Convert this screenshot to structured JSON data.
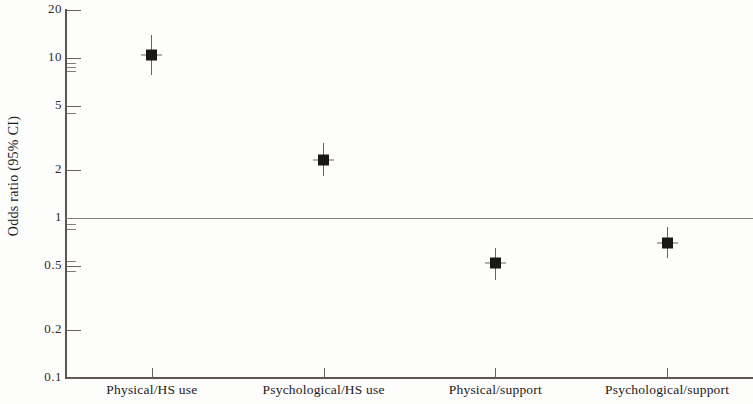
{
  "chart_data": {
    "type": "scatter",
    "title": "",
    "subtitle": "",
    "xlabel": "",
    "ylabel": "Odds ratio (95% CI)",
    "yscale": "log",
    "ylim": [
      0.1,
      20
    ],
    "grid": false,
    "legend": "none",
    "reference_line": {
      "value": 1,
      "label": "1",
      "color": "#8a7f78"
    },
    "ytick_labels": [
      "20",
      "10",
      "5",
      "2",
      "1",
      "0.5",
      "0.2",
      "0.1"
    ],
    "ytick_values": [
      20,
      10,
      5,
      2,
      1,
      0.5,
      0.2,
      0.1
    ],
    "categories": [
      "Physical/HS use",
      "Psychological/HS use",
      "Physical/support",
      "Psychological/support"
    ],
    "values": [
      10.5,
      2.3,
      0.52,
      0.7
    ],
    "ci_low": [
      8.6,
      2.0,
      0.45,
      0.61
    ],
    "ci_high": [
      12.8,
      2.7,
      0.6,
      0.81
    ],
    "series": [
      {
        "name": "Odds ratio",
        "marker": "filled-square",
        "color": "#1a1714",
        "points": [
          {
            "category": "Physical/HS use",
            "value": 10.5,
            "ci_low": 8.6,
            "ci_high": 12.8
          },
          {
            "category": "Psychological/HS use",
            "value": 2.3,
            "ci_low": 2.0,
            "ci_high": 2.7
          },
          {
            "category": "Physical/support",
            "value": 0.52,
            "ci_low": 0.45,
            "ci_high": 0.6
          },
          {
            "category": "Psychological/support",
            "value": 0.7,
            "ci_low": 0.61,
            "ci_high": 0.81
          }
        ]
      }
    ]
  },
  "axis": {
    "y_title": "Odds ratio (95% CI)",
    "ticks": [
      {
        "label": "20",
        "value": 20
      },
      {
        "label": "10",
        "value": 10
      },
      {
        "label": "5",
        "value": 5
      },
      {
        "label": "2",
        "value": 2
      },
      {
        "label": "1",
        "value": 1
      },
      {
        "label": "0.5",
        "value": 0.5
      },
      {
        "label": "0.2",
        "value": 0.2
      },
      {
        "label": "0.1",
        "value": 0.1
      }
    ],
    "x_categories": [
      {
        "label": "Physical/HS use"
      },
      {
        "label": "Psychological/HS use"
      },
      {
        "label": "Physical/support"
      },
      {
        "label": "Psychological/support"
      }
    ]
  },
  "colors": {
    "axis": "#5d564e",
    "marker": "#1a1714",
    "reference": "#8a7f78",
    "background": "#fdfdfb",
    "text": "#23201d"
  }
}
